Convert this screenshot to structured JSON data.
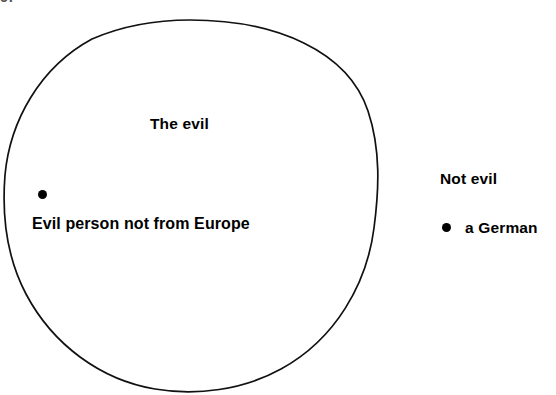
{
  "figure": {
    "page_number_fragment": "9.",
    "type": "euler-diagram",
    "background_color": "#ffffff",
    "ink_color": "#000000"
  },
  "set_circle": {
    "name": "the-evil-set",
    "stroke_color": "#111111",
    "stroke_width": 1.7,
    "center_x": 190,
    "center_y": 205,
    "radius_x": 187,
    "radius_y": 185
  },
  "labels": {
    "set_title": "The evil",
    "inside_member": "Evil person not from Europe",
    "outside_title": "Not evil",
    "outside_member": "a  German"
  },
  "members": [
    {
      "name": "evil-person-not-from-europe",
      "label": "Evil person not from Europe",
      "inside_set": true,
      "dot_x": 42,
      "dot_y": 195
    },
    {
      "name": "a-german",
      "label": "a  German",
      "inside_set": false,
      "dot_x": 447,
      "dot_y": 228
    }
  ],
  "diagram_data": {
    "type": "euler",
    "sets": [
      {
        "name": "The evil",
        "members": [
          "Evil person not from Europe"
        ]
      }
    ],
    "outside_region": {
      "name": "Not evil",
      "members": [
        "a  German"
      ]
    }
  }
}
